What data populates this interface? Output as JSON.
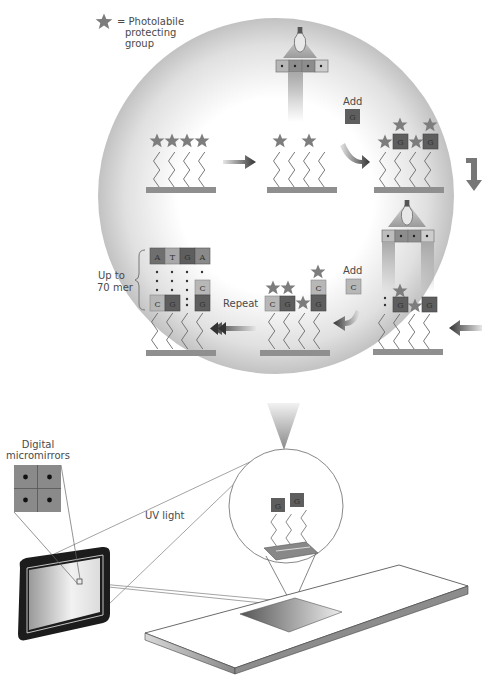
{
  "legend": {
    "symbol": "star-icon",
    "text_line1": "= Photolabile",
    "text_line2": "protecting",
    "text_line3": "group"
  },
  "steps": {
    "add_g": {
      "label": "Add",
      "base": "G"
    },
    "add_c": {
      "label": "Add",
      "base": "C"
    },
    "repeat": "Repeat",
    "length": {
      "line1": "Up to",
      "line2": "70 mer"
    },
    "top_sequence": [
      "A",
      "T",
      "G",
      "A"
    ],
    "final_bottom": [
      "C",
      "G",
      "",
      "G"
    ],
    "final_stack_c": "C"
  },
  "hardware": {
    "micromirrors_line1": "Digital",
    "micromirrors_line2": "micromirrors",
    "uv_light": "UV light",
    "zoom_bases": [
      "G",
      "G"
    ]
  },
  "colors": {
    "background": "#ffffff",
    "circle_center": "#ffffff",
    "circle_edge": "#c4c4c4",
    "star": "#7d7d7d",
    "base_G": "#5e5e5e",
    "base_C": "#b7b7b7",
    "base_A": "#8a8a8a",
    "base_T": "#a7a7a7",
    "substrate": "#8f8f8f",
    "arrow_dark": "#3a3a3a"
  }
}
